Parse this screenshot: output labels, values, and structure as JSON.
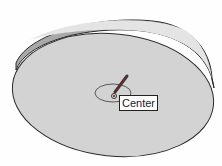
{
  "viewport": {
    "tool": "circle-tool",
    "inference_tooltip": "Center",
    "colors": {
      "background": "#fefefe",
      "disk_face": "#d3d3d3",
      "disk_rim": "#a8a8a8",
      "rim_highlight": "#e6e6e6",
      "edge": "#2a2a2a",
      "cursor_pencil": "#3a3a3a",
      "center_point": "#8b1a1a"
    }
  }
}
